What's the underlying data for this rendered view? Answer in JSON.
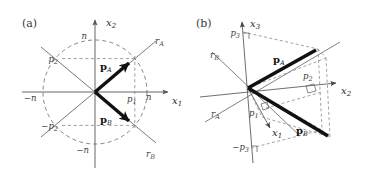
{
  "figure": {
    "background": "#ffffff",
    "ink": "#1a1a1a",
    "axis_color": "#555555",
    "dash_color": "#777777",
    "vector_color": "#111111",
    "width": 370,
    "height": 187
  },
  "panels": [
    {
      "id": "a",
      "label": "(a)",
      "type": "2d-plane-with-unit-circle",
      "origin": [
        95,
        92
      ],
      "circle_radius": 52,
      "axes": [
        {
          "name": "x1",
          "label": "x",
          "sub": "1",
          "direction": "right"
        },
        {
          "name": "x2",
          "label": "x",
          "sub": "2",
          "direction": "up"
        }
      ],
      "rays": [
        {
          "name": "rA",
          "label": "r",
          "sub": "A",
          "angle_deg": 40
        },
        {
          "name": "rB",
          "label": "r",
          "sub": "B",
          "angle_deg": -40
        }
      ],
      "vectors": [
        {
          "name": "pA",
          "label": "p",
          "sub": "A",
          "angle_deg": 40,
          "length": 52
        },
        {
          "name": "pB",
          "label": "p",
          "sub": "B",
          "angle_deg": -40,
          "length": 52
        }
      ],
      "tick_labels": [
        {
          "name": "tick-n-top",
          "text": "n",
          "axis": "x2",
          "sign": "+"
        },
        {
          "name": "tick-neg-n-bottom",
          "text": "−n",
          "axis": "x2",
          "sign": "−"
        },
        {
          "name": "tick-n-right",
          "text": "n",
          "axis": "x1",
          "sign": "+"
        },
        {
          "name": "tick-neg-n-left",
          "text": "−n",
          "axis": "x1",
          "sign": "−"
        },
        {
          "name": "proj-p2",
          "text": "p",
          "sub": "2"
        },
        {
          "name": "proj-neg-p2",
          "text": "−p",
          "sub": "2"
        },
        {
          "name": "proj-p1",
          "text": "p",
          "sub": "1"
        }
      ]
    },
    {
      "id": "b",
      "label": "(b)",
      "type": "3d-perspective-projection",
      "origin": [
        248,
        88
      ],
      "axes": [
        {
          "name": "x1",
          "label": "x",
          "sub": "1",
          "direction": "down-right-oblique"
        },
        {
          "name": "x2",
          "label": "x",
          "sub": "2",
          "direction": "right"
        },
        {
          "name": "x3",
          "label": "x",
          "sub": "3",
          "direction": "up"
        }
      ],
      "rays": [
        {
          "name": "rA",
          "label": "r",
          "sub": "A"
        },
        {
          "name": "rB",
          "label": "r",
          "sub": "B"
        }
      ],
      "vectors": [
        {
          "name": "pA",
          "label": "p",
          "sub": "A"
        },
        {
          "name": "pB",
          "label": "p",
          "sub": "B"
        }
      ],
      "tick_labels": [
        {
          "name": "proj-p1",
          "text": "p",
          "sub": "1"
        },
        {
          "name": "proj-p2",
          "text": "p",
          "sub": "2"
        },
        {
          "name": "proj-p3",
          "text": "p",
          "sub": "3"
        },
        {
          "name": "proj-neg-p3",
          "text": "−p",
          "sub": "3"
        }
      ],
      "right_angle_markers": 4
    }
  ]
}
